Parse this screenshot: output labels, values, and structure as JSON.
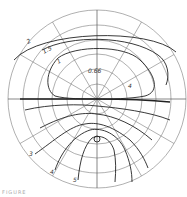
{
  "diagram": {
    "type": "polar contour plot",
    "contour_labels": [
      "2",
      "1.5",
      "1",
      "0.66",
      "4",
      "3",
      "4",
      "5"
    ],
    "caption": "FIGURE"
  }
}
